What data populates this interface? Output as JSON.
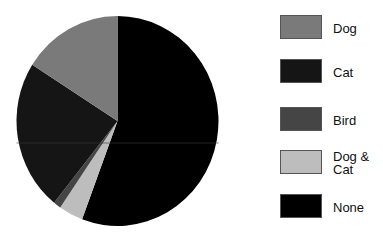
{
  "chart_data": {
    "type": "pie",
    "title": "",
    "start_angle_deg": 0,
    "direction": "clockwise",
    "slices": [
      {
        "label": "None",
        "value": 55.7,
        "color": "#000000"
      },
      {
        "label": "Dog & Cat",
        "value": 3.9,
        "color": "#bdbdbd"
      },
      {
        "label": "Bird",
        "value": 1.2,
        "color": "#454545"
      },
      {
        "label": "Cat",
        "value": 23.2,
        "color": "#151515"
      },
      {
        "label": "Dog",
        "value": 16.0,
        "color": "#7a7a7a"
      }
    ],
    "legend_position": "right",
    "legend": [
      {
        "label": "Dog",
        "color": "#7a7a7a"
      },
      {
        "label": "Cat",
        "color": "#151515"
      },
      {
        "label": "Bird",
        "color": "#454545"
      },
      {
        "label": "Dog &\nCat",
        "color": "#bdbdbd"
      },
      {
        "label": "None",
        "color": "#000000"
      }
    ]
  },
  "legend": {
    "items": [
      {
        "label": "Dog",
        "top": 15
      },
      {
        "label": "Cat",
        "top": 59
      },
      {
        "label": "Bird",
        "top": 107
      },
      {
        "label": "Dog &\nCat",
        "top": 150
      },
      {
        "label": "None",
        "top": 194
      }
    ]
  }
}
